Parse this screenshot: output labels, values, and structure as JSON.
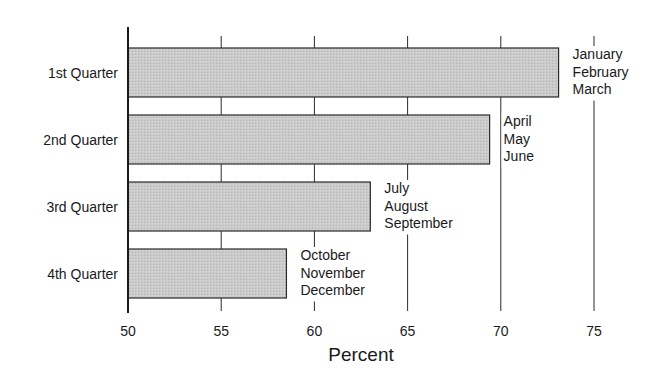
{
  "chart_data": {
    "type": "bar",
    "orientation": "horizontal",
    "title": "",
    "xlabel": "Percent",
    "ylabel": "",
    "xlim": [
      50,
      75
    ],
    "x_ticks": [
      50,
      55,
      60,
      65,
      70,
      75
    ],
    "grid": true,
    "legend": "none",
    "categories": [
      "1st Quarter",
      "2nd Quarter",
      "3rd Quarter",
      "4th Quarter"
    ],
    "values": [
      73.1,
      69.4,
      63.0,
      58.5
    ],
    "annotations": [
      [
        "January",
        "February",
        "March"
      ],
      [
        "April",
        "May",
        "June"
      ],
      [
        "July",
        "August",
        "September"
      ],
      [
        "October",
        "November",
        "December"
      ]
    ],
    "colors": {
      "bar_fill": "#c8c8c8",
      "bar_stroke": "#2a2a2a",
      "axis": "#1a1a1a",
      "grid": "#2a2a2a"
    }
  }
}
